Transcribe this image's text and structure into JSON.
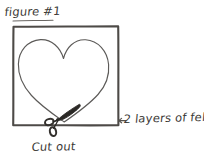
{
  "figure": {
    "title": "figure #1",
    "kind": "hand-drawn craft instruction sketch",
    "background_color": "#ffffff",
    "ink_color": "#3a3835"
  },
  "annotations": {
    "title_label": "figure #1",
    "material_label": "2 layers of felt",
    "action_label": "Cut out"
  },
  "shapes": {
    "fabric_square_label": "felt square outline",
    "heart_label": "heart cutting template outline",
    "scissors_label": "scissors cutting along the heart outline",
    "material_arrow_label": "arrow pointing to felt square edge"
  }
}
